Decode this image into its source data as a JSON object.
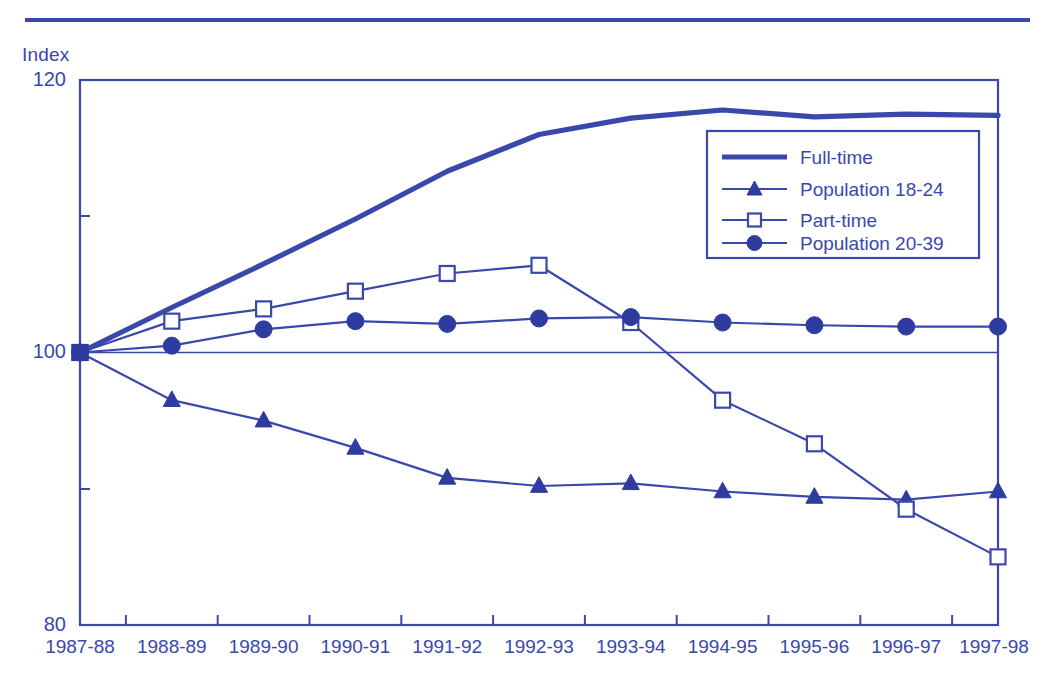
{
  "chart_data": {
    "type": "line",
    "title": "",
    "xlabel": "",
    "ylabel": "Index",
    "ylim": [
      80,
      120
    ],
    "yticks": [
      80,
      100,
      120
    ],
    "ytick_labels": [
      "80",
      "100",
      "120"
    ],
    "grid": false,
    "reference_line": 100,
    "legend_position": "upper-right-inside",
    "categories": [
      "1987-88",
      "1988-89",
      "1989-90",
      "1990-91",
      "1991-92",
      "1992-93",
      "1993-94",
      "1994-95",
      "1995-96",
      "1996-97",
      "1997-98"
    ],
    "series": [
      {
        "name": "Full-time",
        "marker": "none",
        "line_weight": "thick",
        "values": [
          100.0,
          103.3,
          106.5,
          109.8,
          113.3,
          116.0,
          117.2,
          117.8,
          117.3,
          117.5,
          117.4
        ]
      },
      {
        "name": "Population 18-24",
        "marker": "triangle-filled",
        "line_weight": "thin",
        "values": [
          100.0,
          96.5,
          95.0,
          93.0,
          90.8,
          90.2,
          90.4,
          89.8,
          89.4,
          89.2,
          89.8
        ]
      },
      {
        "name": "Part-time",
        "marker": "square-open",
        "line_weight": "thin",
        "values": [
          100.0,
          102.3,
          103.2,
          104.5,
          105.8,
          106.4,
          102.2,
          96.5,
          93.3,
          88.5,
          85.0
        ]
      },
      {
        "name": "Population 20-39",
        "marker": "circle-filled",
        "line_weight": "thin",
        "values": [
          100.0,
          100.5,
          101.7,
          102.3,
          102.1,
          102.5,
          102.6,
          102.2,
          102.0,
          101.9,
          101.9
        ]
      }
    ]
  },
  "legend": {
    "entries": [
      {
        "label": "Full-time",
        "marker": "line"
      },
      {
        "label": "Population 18-24",
        "marker": "triangle"
      },
      {
        "label": "Part-time",
        "marker": "square"
      },
      {
        "label": "Population 20-39",
        "marker": "circle"
      }
    ]
  },
  "style": {
    "accent": "#3a48ab",
    "marker_fill": "#2d3c9e",
    "background": "#ffffff"
  }
}
